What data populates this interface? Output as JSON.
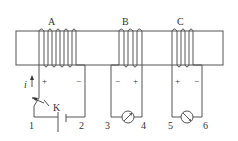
{
  "diagram": {
    "type": "electromagnetic induction circuit",
    "core": {
      "x": 16,
      "y": 31,
      "width": 207,
      "height": 34
    },
    "colors": {
      "stroke": "#555555",
      "text": "#333333",
      "background": "#ffffff"
    },
    "coils": [
      {
        "id": "A",
        "label": "A",
        "turns": 4,
        "polarity_left": "+",
        "polarity_right": "−"
      },
      {
        "id": "B",
        "label": "B",
        "turns": 3,
        "polarity_left": "−",
        "polarity_right": "+"
      },
      {
        "id": "C",
        "label": "C",
        "turns": 3,
        "polarity_left": "+",
        "polarity_right": "−"
      }
    ],
    "current_label": "i",
    "switch_label": "K",
    "terminals": [
      "1",
      "2",
      "3",
      "4",
      "5",
      "6"
    ],
    "components": [
      {
        "name": "switch",
        "label": "K"
      },
      {
        "name": "battery"
      },
      {
        "name": "galvanometer-B"
      },
      {
        "name": "galvanometer-C"
      }
    ]
  }
}
